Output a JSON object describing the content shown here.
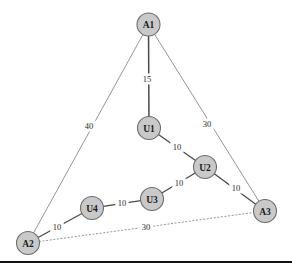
{
  "figure": {
    "width": 292,
    "height": 267,
    "background": "#ffffff"
  },
  "style": {
    "node_fill": "#c9c9c9",
    "node_stroke": "#6e6e6e",
    "node_label_color": "#1c1c1c",
    "edge_color": "#4a4a4a",
    "thin_edge_color": "#7a7a7a",
    "dotted_edge_color": "#8a8a8a",
    "edge_label_color": "#2b2b2b",
    "rule_color": "#111111",
    "node_radius": 11.5,
    "node_label_size": 9.5,
    "edge_label_size": 8.5
  },
  "chart_data": {
    "type": "diagram",
    "subtype": "weighted-graph",
    "title": "",
    "nodes": [
      {
        "id": "A1",
        "label": "A1",
        "x": 148.5,
        "y": 24.5,
        "kind": "anchor"
      },
      {
        "id": "U1",
        "label": "U1",
        "x": 149.0,
        "y": 128.0,
        "kind": "user"
      },
      {
        "id": "U2",
        "label": "U2",
        "x": 205.0,
        "y": 167.0,
        "kind": "user"
      },
      {
        "id": "U3",
        "label": "U3",
        "x": 152.0,
        "y": 199.0,
        "kind": "user"
      },
      {
        "id": "U4",
        "label": "U4",
        "x": 92.0,
        "y": 208.0,
        "kind": "user"
      },
      {
        "id": "A2",
        "label": "A2",
        "x": 28.0,
        "y": 243.0,
        "kind": "anchor"
      },
      {
        "id": "A3",
        "label": "A3",
        "x": 265.0,
        "y": 211.0,
        "kind": "anchor"
      }
    ],
    "edges": [
      {
        "id": "a1-u1",
        "from": "A1",
        "to": "U1",
        "weight": "15",
        "label_x": 147,
        "label_y": 79,
        "style": "solid",
        "thickness": 1.5
      },
      {
        "id": "a1-a2",
        "from": "A1",
        "to": "A2",
        "weight": "40",
        "label_x": 89,
        "label_y": 126,
        "style": "solid",
        "thickness": 0.8
      },
      {
        "id": "a1-a3",
        "from": "A1",
        "to": "A3",
        "weight": "30",
        "label_x": 207,
        "label_y": 124,
        "style": "solid",
        "thickness": 0.8
      },
      {
        "id": "u1-u2",
        "from": "U1",
        "to": "U2",
        "weight": "10",
        "label_x": 177,
        "label_y": 147,
        "style": "solid",
        "thickness": 1.3
      },
      {
        "id": "u2-a3",
        "from": "U2",
        "to": "A3",
        "weight": "10",
        "label_x": 236,
        "label_y": 188,
        "style": "solid",
        "thickness": 1.3
      },
      {
        "id": "u3-u2",
        "from": "U3",
        "to": "U2",
        "weight": "10",
        "label_x": 179,
        "label_y": 183,
        "style": "solid",
        "thickness": 1.3
      },
      {
        "id": "u4-u3",
        "from": "U4",
        "to": "U3",
        "weight": "10",
        "label_x": 122,
        "label_y": 203,
        "style": "solid",
        "thickness": 1.3
      },
      {
        "id": "a2-u4",
        "from": "A2",
        "to": "U4",
        "weight": "10",
        "label_x": 57,
        "label_y": 227,
        "style": "solid",
        "thickness": 1.3
      },
      {
        "id": "a2-a3",
        "from": "A2",
        "to": "A3",
        "weight": "30",
        "label_x": 146,
        "label_y": 227,
        "style": "dotted",
        "thickness": 0.9
      }
    ]
  },
  "rule": {
    "y": 261,
    "thickness": 2.2
  }
}
